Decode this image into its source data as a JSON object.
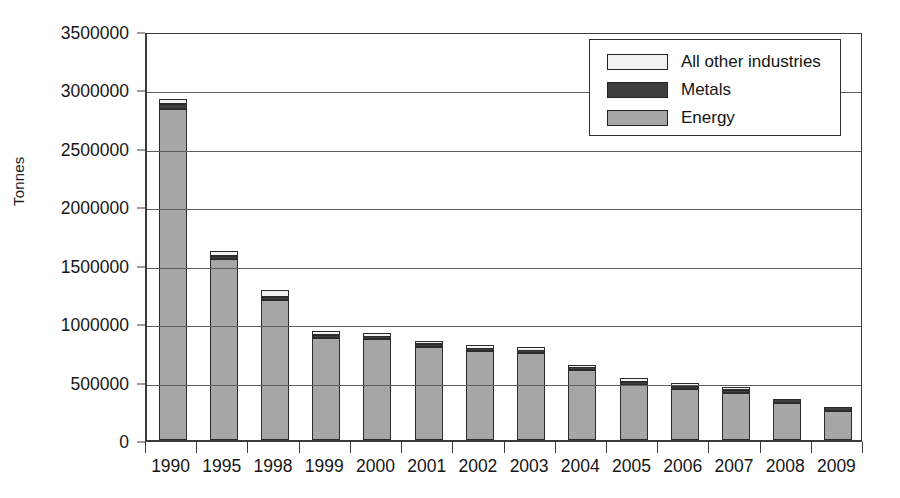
{
  "chart_data": {
    "type": "bar",
    "subtype": "stacked-vertical",
    "title": "",
    "xlabel": "",
    "ylabel": "Tonnes",
    "ylim": [
      0,
      3500000
    ],
    "ytick_step": 500000,
    "yticks": [
      "3500000",
      "3000000",
      "2500000",
      "2000000",
      "1500000",
      "1000000",
      "500000",
      "0"
    ],
    "grid": true,
    "grid_axis": "y",
    "legend_position": "top-right",
    "categories": [
      "1990",
      "1995",
      "1998",
      "1999",
      "2000",
      "2001",
      "2002",
      "2003",
      "2004",
      "2005",
      "2006",
      "2007",
      "2008",
      "2009"
    ],
    "series": [
      {
        "name": "Energy",
        "color": "#a6a6a6",
        "values": [
          2830000,
          1545000,
          1200000,
          875000,
          865000,
          800000,
          760000,
          745000,
          595000,
          475000,
          440000,
          405000,
          320000,
          250000
        ]
      },
      {
        "name": "Metals",
        "color": "#3f3f3f",
        "values": [
          45000,
          30000,
          25000,
          22000,
          20000,
          18000,
          20000,
          18000,
          20000,
          22000,
          25000,
          20000,
          35000,
          35000
        ]
      },
      {
        "name": "All other industries",
        "color": "#f2f2f2",
        "values": [
          45000,
          40000,
          55000,
          38000,
          35000,
          32000,
          35000,
          32000,
          28000,
          33000,
          25000,
          25000,
          0,
          0
        ]
      }
    ],
    "totals": [
      2920000,
      1615000,
      1280000,
      935000,
      920000,
      850000,
      815000,
      795000,
      643000,
      530000,
      490000,
      450000,
      355000,
      285000
    ]
  },
  "legend": {
    "items": [
      {
        "label": "All other industries",
        "swatch": "sw-other"
      },
      {
        "label": "Metals",
        "swatch": "sw-metals"
      },
      {
        "label": "Energy",
        "swatch": "sw-energy"
      }
    ]
  },
  "axis": {
    "y_title": "Tonnes"
  }
}
